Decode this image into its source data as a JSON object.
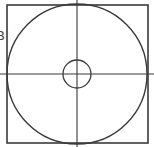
{
  "diagram": {
    "stroke_color": "#3a3a3a",
    "background": "#ffffff",
    "square": {
      "x": 7,
      "y": 5,
      "width": 141,
      "height": 138
    },
    "outer_circle": {
      "cx": 77,
      "cy": 74,
      "r": 70
    },
    "inner_circle": {
      "cx": 77,
      "cy": 74,
      "r": 14
    },
    "crosshair": {
      "horizontal": {
        "x1": 0,
        "x2": 154,
        "y": 74
      },
      "vertical": {
        "x": 77,
        "y1": 0,
        "y2": 147
      }
    }
  },
  "clipped_labels": {
    "top": "-",
    "middle": "B"
  }
}
